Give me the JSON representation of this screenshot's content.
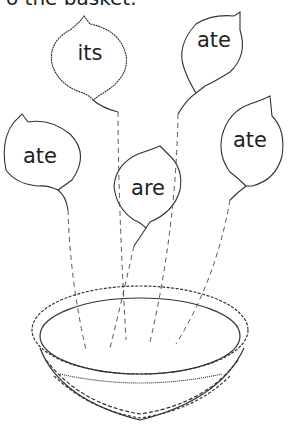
{
  "instruction": "Put the leaves in the basket.",
  "visible_instruction": "o the basket.",
  "leaves": [
    {
      "word": "its"
    },
    {
      "word": "ate"
    },
    {
      "word": "ate"
    },
    {
      "word": "are"
    },
    {
      "word": "ate"
    }
  ]
}
